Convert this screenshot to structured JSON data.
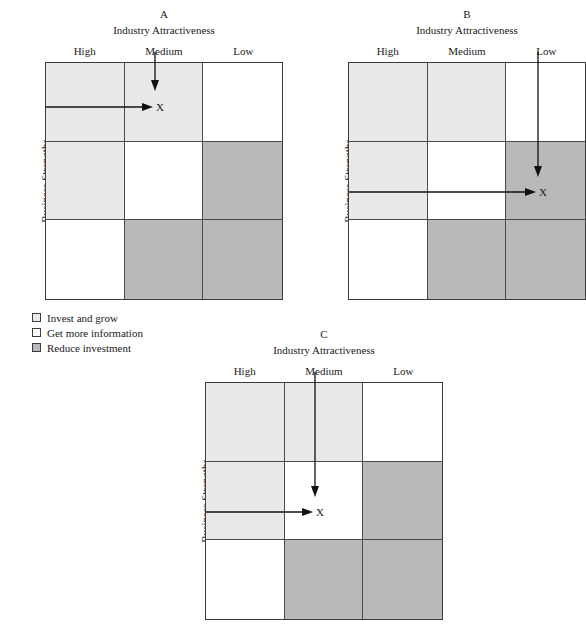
{
  "figure": {
    "shading": {
      "invest": "#e9e9e9",
      "info": "#ffffff",
      "reduce": "#b9b9b9",
      "border": "#4a4a4a",
      "outer_border": "#3c3c3c",
      "arrow": "#111111"
    },
    "column_headers": [
      "High",
      "Medium",
      "Low"
    ],
    "row_headers": [
      "High",
      "Medium",
      "Low"
    ],
    "x_axis_title": "Industry Attractiveness",
    "y_axis_title": "Business Strengths",
    "marker_label": "X"
  },
  "legend": {
    "items": [
      {
        "label": "Invest and grow",
        "color": "#e9e9e9"
      },
      {
        "label": "Get more information",
        "color": "#ffffff"
      },
      {
        "label": "Reduce investment",
        "color": "#b9b9b9"
      }
    ]
  },
  "panels": [
    {
      "letter": "A",
      "x_axis_title": "Industry Attractiveness",
      "y_axis_title": "Business Strengths",
      "column_headers": [
        "High",
        "Medium",
        "Low"
      ],
      "row_headers": [
        "High",
        "Medium",
        "Low"
      ],
      "cells": [
        [
          "invest",
          "invest",
          "info"
        ],
        [
          "invest",
          "info",
          "reduce"
        ],
        [
          "info",
          "reduce",
          "reduce"
        ]
      ],
      "marker": {
        "label": "X",
        "row": "High",
        "column": "Medium"
      },
      "clipped": false
    },
    {
      "letter": "B",
      "x_axis_title": "Industry Attractiveness",
      "y_axis_title": "Business Strengths",
      "column_headers": [
        "High",
        "Medium",
        "Low"
      ],
      "row_headers": [
        "High",
        "Medium",
        "Low"
      ],
      "cells": [
        [
          "invest",
          "invest",
          "info"
        ],
        [
          "invest",
          "info",
          "reduce"
        ],
        [
          "info",
          "reduce",
          "reduce"
        ]
      ],
      "marker": {
        "label": "X",
        "row": "Medium",
        "column": "Low"
      },
      "clipped": true
    },
    {
      "letter": "C",
      "x_axis_title": "Industry Attractiveness",
      "y_axis_title": "Business Strengths",
      "column_headers": [
        "High",
        "Medium",
        "Low"
      ],
      "row_headers": [
        "High",
        "Medium",
        "Low"
      ],
      "cells": [
        [
          "invest",
          "invest",
          "info"
        ],
        [
          "invest",
          "info",
          "reduce"
        ],
        [
          "info",
          "reduce",
          "reduce"
        ]
      ],
      "marker": {
        "label": "X",
        "row": "Medium",
        "column": "Medium"
      },
      "clipped": false
    }
  ]
}
